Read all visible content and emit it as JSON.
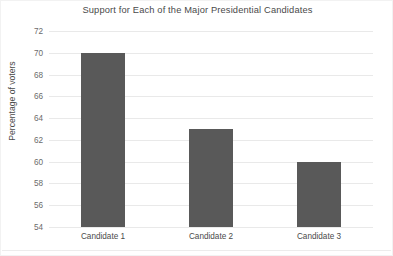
{
  "chart_data": {
    "type": "bar",
    "title": "Support  for Each of the Major Presidential Candidates",
    "categories": [
      "Candidate 1",
      "Candidate 2",
      "Candidate 3"
    ],
    "values": [
      70,
      63,
      60
    ],
    "series": [
      {
        "name": "Percentage of voters",
        "values": [
          70,
          63,
          60
        ]
      }
    ],
    "xlabel": "",
    "ylabel": "Percentage of voters",
    "ylim": [
      54,
      72
    ],
    "ytick_step": 2,
    "yticks": [
      72,
      70,
      68,
      66,
      64,
      62,
      60,
      58,
      56,
      54
    ],
    "grid": true,
    "gridlines": "horizontal",
    "legend": false,
    "bar_color": "#595959",
    "gridline_color": "#e9e9e9",
    "text_color": "#4a4a4a",
    "background_color": "#ffffff"
  }
}
